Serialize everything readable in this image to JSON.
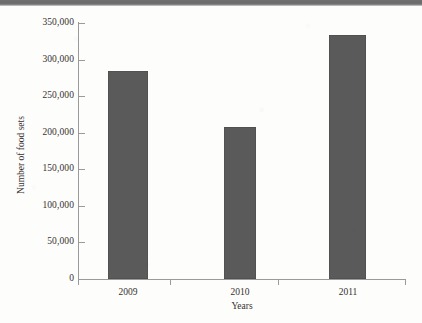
{
  "figure": {
    "background_color": "#fdfdfc",
    "scan_band_color": "#6f6f6f",
    "axis_color": "#9a9a9a",
    "text_color": "#35312e"
  },
  "chart_data": {
    "type": "bar",
    "title": "",
    "xlabel": "Years",
    "ylabel": "Number of food sets",
    "categories": [
      "2009",
      "2010",
      "2011"
    ],
    "values": [
      285000,
      208000,
      333000
    ],
    "series": [
      {
        "name": "Number of food sets",
        "values": [
          285000,
          208000,
          333000
        ],
        "color": "#5a5a5a"
      }
    ],
    "ylim": [
      0,
      350000
    ],
    "ytick_values": [
      0,
      50000,
      100000,
      150000,
      200000,
      250000,
      300000,
      350000
    ],
    "ytick_labels": [
      "0",
      "50,000",
      "100,000",
      "150,000",
      "200,000",
      "250,000",
      "300,000",
      "350,000"
    ],
    "xtick_labels": [
      "2009",
      "2010",
      "2011"
    ],
    "grid": false,
    "legend": false,
    "legend_position": "none",
    "bar_color": "#5a5a5a"
  }
}
